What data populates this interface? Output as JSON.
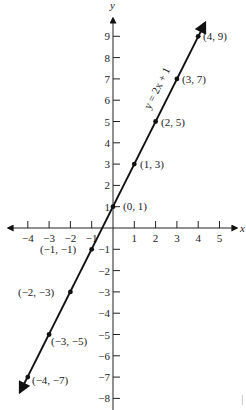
{
  "chart_data": {
    "type": "line",
    "title": "",
    "xlabel": "x",
    "ylabel": "y",
    "equation": "y = 2x + 1",
    "xlim": [
      -4.5,
      5.5
    ],
    "ylim": [
      -8.5,
      10
    ],
    "grid": false,
    "x_ticks": [
      -4,
      -3,
      -2,
      -1,
      1,
      2,
      3,
      4,
      5
    ],
    "y_ticks": [
      9,
      8,
      7,
      6,
      5,
      4,
      3,
      2,
      1,
      -1,
      -2,
      -3,
      -4,
      -5,
      -6,
      -7,
      -8
    ],
    "x_tick_labels": [
      "−4",
      "−3",
      "−2",
      "−1",
      "1",
      "2",
      "3",
      "4",
      "5"
    ],
    "y_tick_labels": [
      "9",
      "8",
      "7",
      "6",
      "5",
      "4",
      "3",
      "2",
      "1",
      "−1",
      "−2",
      "−3",
      "−4",
      "−5",
      "−6",
      "−7",
      "−8"
    ],
    "series": [
      {
        "name": "y = 2x + 1",
        "points": [
          {
            "x": -4,
            "y": -7,
            "label": "(−4, −7)"
          },
          {
            "x": -3,
            "y": -5,
            "label": "(−3, −5)"
          },
          {
            "x": -2,
            "y": -3,
            "label": "(−2, −3)"
          },
          {
            "x": -1,
            "y": -1,
            "label": "(−1, −1)"
          },
          {
            "x": 0,
            "y": 1,
            "label": "(0, 1)"
          },
          {
            "x": 1,
            "y": 3,
            "label": "(1, 3)"
          },
          {
            "x": 2,
            "y": 5,
            "label": "(2, 5)"
          },
          {
            "x": 3,
            "y": 7,
            "label": "(3, 7)"
          },
          {
            "x": 4,
            "y": 9,
            "label": "(4, 9)"
          }
        ]
      }
    ]
  },
  "labels": {
    "x_axis": "x",
    "y_axis": "y",
    "equation": "y = 2x + 1",
    "p_m4": "(−4, −7)",
    "p_m3": "(−3, −5)",
    "p_m2": "(−2, −3)",
    "p_m1": "(−1, −1)",
    "p_0": "(0, 1)",
    "p_1": "(1, 3)",
    "p_2": "(2, 5)",
    "p_3": "(3, 7)",
    "p_4": "(4, 9)"
  },
  "colors": {
    "ink": "#111111",
    "background": "#ffffff"
  }
}
